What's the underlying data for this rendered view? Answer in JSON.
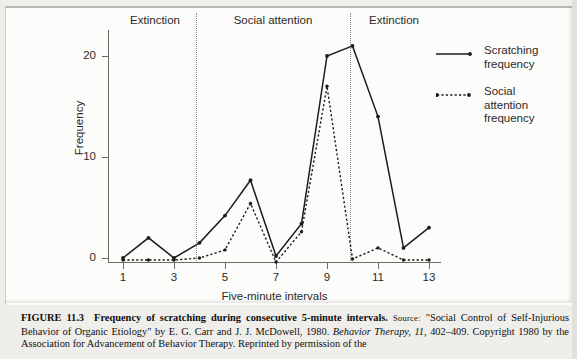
{
  "figure": {
    "caption_number": "FIGURE 11.3",
    "caption_title": "Frequency of scratching during consecutive 5-minute intervals.",
    "source_label": "Source:",
    "source_text_1": "\"Social Control of",
    "source_text_2": "Self-Injurious Behavior of Organic Etiology\" by E. G. Carr and J. J. McDowell, 1980. ",
    "source_journal": "Behavior Therapy, 11",
    "source_text_3": ", 402–409.",
    "source_text_4": "Copyright 1980 by the Association for Advancement of Behavior Therapy. Reprinted by permission of the"
  },
  "chart_data": {
    "type": "line",
    "title": "Frequency of scratching during consecutive 5-minute intervals",
    "xlabel": "Five-minute intervals",
    "ylabel": "Frequency",
    "xlim": [
      0.4,
      13.6
    ],
    "ylim": [
      -1,
      23
    ],
    "grid": false,
    "legend_position": "right",
    "x": [
      1,
      2,
      3,
      4,
      5,
      6,
      7,
      8,
      9,
      10,
      11,
      12,
      13
    ],
    "xticks": [
      1,
      3,
      5,
      7,
      9,
      11,
      13
    ],
    "xtick_labels": [
      "1",
      "3",
      "5",
      "7",
      "9",
      "11",
      "13"
    ],
    "yticks": [
      0,
      10,
      20
    ],
    "ytick_labels": [
      "0",
      "10",
      "20"
    ],
    "series": [
      {
        "name": "Scratching frequency",
        "style": "solid",
        "values": [
          0,
          2,
          0,
          1.5,
          4.2,
          7.7,
          0.2,
          3.4,
          20,
          21,
          14,
          1,
          3
        ]
      },
      {
        "name": "Social attention frequency",
        "style": "dotted",
        "values": [
          -0.2,
          -0.2,
          -0.2,
          0,
          0.8,
          5.4,
          -0.4,
          2.6,
          17,
          -0.1,
          1,
          -0.2,
          -0.2
        ]
      }
    ],
    "phases": [
      {
        "label": "Extinction",
        "from": 1,
        "to": 3
      },
      {
        "label": "Social attention",
        "from": 4,
        "to": 9
      },
      {
        "label": "Extinction",
        "from": 10,
        "to": 13
      }
    ],
    "phase_dividers": [
      3.5,
      9.5
    ]
  },
  "legend": {
    "items": [
      {
        "label_line1": "Scratching",
        "label_line2": "frequency",
        "style": "solid"
      },
      {
        "label_line1": "Social",
        "label_line2": "attention",
        "label_line3": "frequency",
        "style": "dotted"
      }
    ]
  },
  "colors": {
    "ink": "#1d1c1a",
    "axis": "#6d6b66",
    "page": "#efeeea",
    "panel": "#fcfcfa"
  }
}
